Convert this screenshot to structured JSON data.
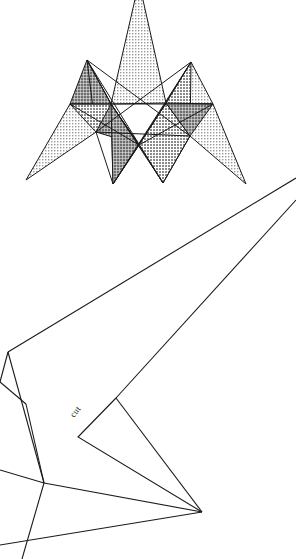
{
  "figure": {
    "background_color": "#ffffff",
    "stroke_color": "#1a1a1a",
    "width": 296,
    "height": 559
  },
  "star": {
    "name": "shaded-star-polygon",
    "description": "Seven-pointed interlocking star made of overlapping shaded triangular spikes",
    "fill_light": "#d9d9d9",
    "fill_mid": "#b5b5b5",
    "fill_dark": "#8f8f8f",
    "stroke_color": "#1a1a1a",
    "stroke_width": 1,
    "center": {
      "x": 148,
      "y": 112
    },
    "spikes": [
      {
        "name": "spike-top",
        "tip": {
          "x": 139,
          "y": -18
        },
        "shade": "light"
      },
      {
        "name": "spike-upper-right",
        "tip": {
          "x": 191,
          "y": 62
        },
        "shade": "light"
      },
      {
        "name": "spike-right",
        "tip": {
          "x": 246,
          "y": 184
        },
        "shade": "light"
      },
      {
        "name": "spike-lower-right",
        "tip": {
          "x": 163,
          "y": 183
        },
        "shade": "light"
      },
      {
        "name": "spike-bottom",
        "tip": {
          "x": 113,
          "y": 184
        },
        "shade": "light"
      },
      {
        "name": "spike-left",
        "tip": {
          "x": 26,
          "y": 180
        },
        "shade": "light"
      },
      {
        "name": "spike-upper-left",
        "tip": {
          "x": 87,
          "y": 60
        },
        "shade": "dark"
      }
    ],
    "inner_vertices": [
      {
        "x": 111,
        "y": 104
      },
      {
        "x": 166,
        "y": 103
      },
      {
        "x": 139,
        "y": 145
      },
      {
        "x": 70,
        "y": 104
      },
      {
        "x": 213,
        "y": 104
      }
    ]
  },
  "fold_pattern": {
    "name": "fold-and-cut-pattern",
    "description": "Large open polygon with straight fold creases converging to a right-hand vertex",
    "stroke_color": "#1a1a1a",
    "stroke_width": 1.1,
    "vertices": {
      "right_edge_upper": {
        "x": 296,
        "y": 178
      },
      "right_edge_lower": {
        "x": 296,
        "y": 200
      },
      "left_notch_top": {
        "x": 8,
        "y": 352
      },
      "left_mid": {
        "x": 0,
        "y": 382
      },
      "junction_left": {
        "x": 44,
        "y": 483
      },
      "cut_apex": {
        "x": 78,
        "y": 437
      },
      "cut_upper": {
        "x": 116,
        "y": 398
      },
      "converge_right": {
        "x": 202,
        "y": 512
      },
      "bottom_left_exit": {
        "x": 0,
        "y": 545
      },
      "left_exit_mid": {
        "x": 0,
        "y": 470
      },
      "left_exit_lower": {
        "x": 22,
        "y": 559
      }
    }
  },
  "labels": {
    "cut": {
      "text": "cut",
      "rotation_deg": -52,
      "x": 74,
      "y": 418,
      "color": "#2b2b2b"
    }
  }
}
